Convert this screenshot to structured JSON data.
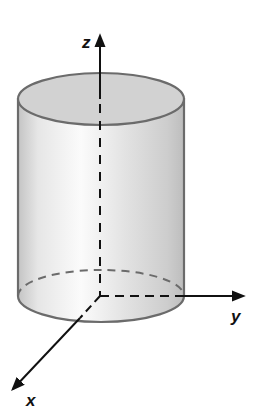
{
  "diagram": {
    "type": "3d-cylinder-on-axes",
    "axes": {
      "z": {
        "label": "z"
      },
      "y": {
        "label": "y"
      },
      "x": {
        "label": "x"
      }
    },
    "colors": {
      "outline": "#6b6b6b",
      "top_face": "#d2d2d2",
      "body_dark": "#bdbdbd",
      "body_light": "#fafafa",
      "axis": "#111111",
      "hidden_edge": "#6b6b6b"
    }
  }
}
